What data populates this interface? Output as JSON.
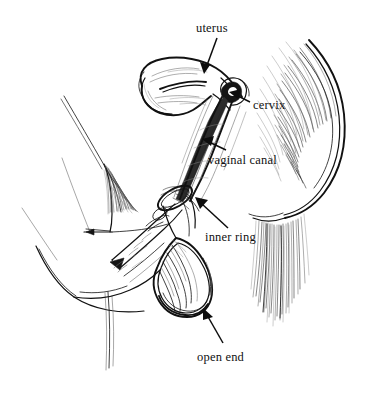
{
  "figure": {
    "kind": "anatomical-line-drawing",
    "style": "black and white pen-and-ink hatching",
    "background_color": "#ffffff",
    "ink_color": "#111111",
    "width": 372,
    "height": 394
  },
  "labels": [
    {
      "id": "uterus",
      "text": "uterus",
      "x": 196,
      "y": 22,
      "arrow": {
        "from_x": 217,
        "from_y": 38,
        "to_x": 204,
        "to_y": 73
      }
    },
    {
      "id": "cervix",
      "text": "cervix",
      "x": 253,
      "y": 99,
      "arrow": {
        "from_x": 250,
        "from_y": 102,
        "to_x": 230,
        "to_y": 93
      }
    },
    {
      "id": "vaginal-canal",
      "text": "vaginal canal",
      "x": 208,
      "y": 154,
      "arrow": {
        "from_x": 226,
        "from_y": 150,
        "to_x": 203,
        "to_y": 140
      }
    },
    {
      "id": "inner-ring",
      "text": "inner ring",
      "x": 205,
      "y": 231,
      "arrow": {
        "from_x": 228,
        "from_y": 228,
        "to_x": 196,
        "to_y": 198
      }
    },
    {
      "id": "open-end",
      "text": "open end",
      "x": 197,
      "y": 351,
      "arrow": {
        "from_x": 223,
        "from_y": 343,
        "to_x": 203,
        "to_y": 310
      }
    }
  ],
  "anatomy_parts": [
    {
      "id": "uterus-body",
      "name": "uterus"
    },
    {
      "id": "cervix-knob",
      "name": "cervix"
    },
    {
      "id": "vaginal-canal-tube",
      "name": "vaginal canal"
    },
    {
      "id": "condom-inner-ring",
      "name": "inner ring"
    },
    {
      "id": "condom-open-end",
      "name": "open end"
    },
    {
      "id": "hand-fingers",
      "name": "hand inserting condom"
    },
    {
      "id": "buttock-contour",
      "name": "buttock and thigh"
    },
    {
      "id": "abdomen-contour",
      "name": "abdomen and pubic area"
    }
  ]
}
